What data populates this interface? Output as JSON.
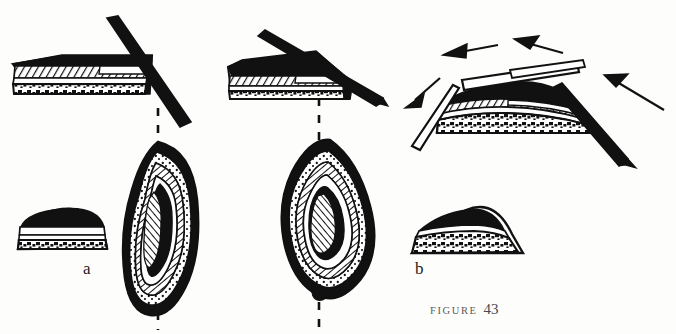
{
  "figure": {
    "caption_word": "FIGURE",
    "caption_number": "43",
    "panel_a_label": "a",
    "panel_b_label": "b",
    "background_color": "#fdfdfc",
    "ink_color": "#111111"
  },
  "panels": [
    {
      "id": "a",
      "label": "a",
      "description": "Flat tabular core with straight blade detached at steep angle; resulting plan-view of a teardrop-shaped biface",
      "core_shape": "flat-slab",
      "blade_count": 1,
      "arrow_count": 0,
      "section_shape": "low-dome"
    },
    {
      "id": "b",
      "label": "b",
      "description": "Convex domed core with multiple blades removed, force arrows indicating percussion directions; resulting plan-view of a lenticular biface",
      "core_shape": "domed",
      "blade_count": 3,
      "arrow_count": 4,
      "section_shape": "asymmetric-dome"
    }
  ],
  "layers": [
    {
      "name": "cortex-top",
      "pattern": "solid-black",
      "color": "#111111"
    },
    {
      "name": "band-hatched",
      "pattern": "diagonal-hatch",
      "color": "#111111"
    },
    {
      "name": "band-white",
      "pattern": "blank",
      "color": "#ffffff"
    },
    {
      "name": "band-stipple",
      "pattern": "stipple-dots",
      "color": "#111111"
    }
  ],
  "guides": [
    {
      "name": "axis-a",
      "orientation": "vertical",
      "style": "dashed",
      "x": 158
    },
    {
      "name": "axis-b",
      "orientation": "vertical",
      "style": "dashed",
      "x": 319
    }
  ],
  "blades": [
    {
      "panel": "a",
      "fill": "solid-black",
      "angle_deg": 62
    },
    {
      "panel": "b",
      "fill": "solid-black",
      "angle_deg": 22
    },
    {
      "panel": "b",
      "fill": "outline-white",
      "angle_deg": -6
    },
    {
      "panel": "b",
      "fill": "outline-white",
      "angle_deg": 72
    },
    {
      "panel": "b",
      "fill": "solid-black",
      "angle_deg": 58
    }
  ],
  "arrows": [
    {
      "name": "arrow-left-down",
      "direction": "down-left"
    },
    {
      "name": "arrow-left-horizontal",
      "direction": "left"
    },
    {
      "name": "arrow-upper-right",
      "direction": "up-left"
    },
    {
      "name": "arrow-lower-right",
      "direction": "up-left"
    }
  ]
}
